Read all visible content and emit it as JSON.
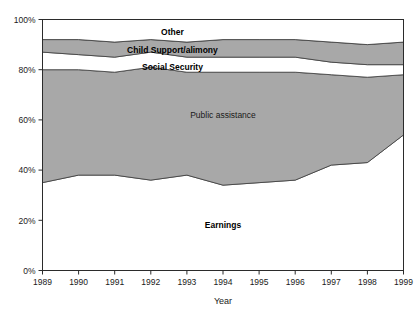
{
  "chart_data": {
    "type": "area",
    "title": "",
    "xlabel": "Year",
    "ylabel": "",
    "stacked": true,
    "normalized_percent": true,
    "grid": false,
    "legend_position": "inline-labels",
    "xlim": [
      1989,
      1999
    ],
    "ylim": [
      0,
      100
    ],
    "categories": [
      "1989",
      "1990",
      "1991",
      "1992",
      "1993",
      "1994",
      "1995",
      "1996",
      "1997",
      "1998",
      "1999"
    ],
    "x_tick_labels": [
      "1989",
      "1990",
      "1991",
      "1992",
      "1993",
      "1994",
      "1995",
      "1996",
      "1997",
      "1998",
      "1999"
    ],
    "y_tick_labels": [
      "0%",
      "20%",
      "40%",
      "60%",
      "80%",
      "100%"
    ],
    "y_ticks": [
      0,
      20,
      40,
      60,
      80,
      100
    ],
    "series": [
      {
        "name": "Earnings",
        "fill": "#ffffff",
        "values": [
          35,
          38,
          38,
          36,
          38,
          34,
          35,
          36,
          42,
          43,
          54
        ]
      },
      {
        "name": "Public assistance",
        "fill": "#a8a8a8",
        "values": [
          45,
          42,
          41,
          45,
          41,
          45,
          44,
          43,
          36,
          34,
          24
        ]
      },
      {
        "name": "Social Security",
        "fill": "#ffffff",
        "values": [
          7,
          6,
          6,
          6,
          6,
          6,
          6,
          6,
          5,
          5,
          4
        ]
      },
      {
        "name": "Child Support/alimony",
        "fill": "#a8a8a8",
        "values": [
          5,
          6,
          6,
          5,
          6,
          7,
          7,
          7,
          8,
          8,
          9
        ]
      },
      {
        "name": "Other",
        "fill": "#ffffff",
        "values": [
          8,
          8,
          9,
          8,
          9,
          8,
          8,
          8,
          9,
          10,
          9
        ]
      }
    ],
    "series_label_positions": [
      {
        "name": "Other",
        "x": 1992.6,
        "y": 95
      },
      {
        "name": "Child Support/alimony",
        "x": 1992.6,
        "y": 88
      },
      {
        "name": "Social Security",
        "x": 1992.6,
        "y": 81
      },
      {
        "name": "Public assistance",
        "x": 1994.0,
        "y": 62
      },
      {
        "name": "Earnings",
        "x": 1994.0,
        "y": 18
      }
    ],
    "colors": {
      "band_gray": "#a8a8a8",
      "band_white": "#ffffff",
      "axis": "#2b2b2b",
      "border": "#2b2b2b",
      "text": "#1a1a1a"
    }
  },
  "labels": {
    "other": "Other",
    "child_support": "Child Support/alimony",
    "social_security": "Social Security",
    "public_assistance": "Public assistance",
    "earnings": "Earnings",
    "axis_year": "Year",
    "y0": "0%",
    "y20": "20%",
    "y40": "40%",
    "y60": "60%",
    "y80": "80%",
    "y100": "100%",
    "x1989": "1989",
    "x1990": "1990",
    "x1991": "1991",
    "x1992": "1992",
    "x1993": "1993",
    "x1994": "1994",
    "x1995": "1995",
    "x1996": "1996",
    "x1997": "1997",
    "x1998": "1998",
    "x1999": "1999"
  }
}
